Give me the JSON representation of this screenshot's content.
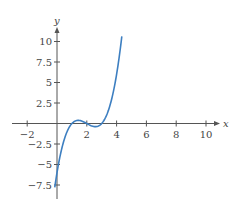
{
  "chart_data": {
    "type": "line",
    "title": "",
    "xlabel": "x",
    "ylabel": "y",
    "function": "y = (x - 1)(x - 2)(x - 3)",
    "x_domain": [
      -0.15,
      4.35
    ],
    "xlim": [
      -3,
      10.8
    ],
    "ylim": [
      -9,
      11
    ],
    "x_ticks": [
      -2,
      2,
      4,
      6,
      8,
      10
    ],
    "x_tick_labels": [
      "−2",
      "2",
      "4",
      "6",
      "8",
      "10"
    ],
    "y_ticks": [
      -7.5,
      -5,
      -2.5,
      2.5,
      5,
      7.5,
      10
    ],
    "y_tick_labels": [
      "−7.5",
      "−5",
      "−2.5",
      "2.5",
      "5",
      "7.5",
      "10"
    ],
    "grid": false,
    "legend": null,
    "series": [
      {
        "name": "f(x)",
        "color": "#3d7fc1",
        "x": [
          -0.15,
          0,
          0.5,
          1,
          1.42,
          2,
          2.58,
          3,
          3.5,
          4,
          4.35
        ],
        "y": [
          -8.2,
          -6,
          -1.88,
          0,
          0.38,
          0,
          -0.38,
          0,
          1.88,
          6,
          10.2
        ]
      }
    ]
  },
  "colors": {
    "axis": "#555555",
    "curve": "#3d7fc1"
  }
}
